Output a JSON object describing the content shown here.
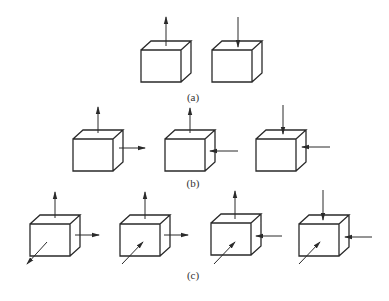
{
  "figure": {
    "colors": {
      "line": "#2a2a2a",
      "background": "#ffffff"
    },
    "rows": [
      {
        "label": "(a)",
        "label_pos": [
          193,
          97
        ],
        "boxes": [
          {
            "front": [
              141,
              50,
              40,
              32
            ],
            "depth": [
              10,
              9
            ],
            "arrows": [
              {
                "dir": "up-out",
                "from": [
                  166,
                  46
                ],
                "to": [
                  166,
                  17
                ]
              }
            ]
          },
          {
            "front": [
              212,
              50,
              40,
              32
            ],
            "depth": [
              10,
              9
            ],
            "arrows": [
              {
                "dir": "down-in",
                "from": [
                  238,
                  17
                ],
                "to": [
                  238,
                  47
                ]
              }
            ]
          }
        ]
      },
      {
        "label": "(b)",
        "label_pos": [
          193,
          183
        ],
        "boxes": [
          {
            "front": [
              73,
              139,
              40,
              32
            ],
            "depth": [
              10,
              9
            ],
            "arrows": [
              {
                "dir": "up-out",
                "from": [
                  98,
                  133
                ],
                "to": [
                  98,
                  107
                ]
              },
              {
                "dir": "right-out",
                "from": [
                  119,
                  148
                ],
                "to": [
                  145,
                  148
                ]
              }
            ]
          },
          {
            "front": [
              165,
              139,
              40,
              32
            ],
            "depth": [
              10,
              9
            ],
            "arrows": [
              {
                "dir": "up-out",
                "from": [
                  190,
                  133
                ],
                "to": [
                  190,
                  108
                ]
              },
              {
                "dir": "left-in",
                "from": [
                  238,
                  151
                ],
                "to": [
                  210,
                  151
                ]
              }
            ]
          },
          {
            "front": [
              256,
              139,
              40,
              32
            ],
            "depth": [
              10,
              9
            ],
            "arrows": [
              {
                "dir": "down-in",
                "from": [
                  283,
                  105
                ],
                "to": [
                  283,
                  134
                ]
              },
              {
                "dir": "left-in",
                "from": [
                  330,
                  147
                ],
                "to": [
                  302,
                  147
                ]
              }
            ]
          }
        ]
      },
      {
        "label": "(c)",
        "label_pos": [
          193,
          275
        ],
        "boxes": [
          {
            "front": [
              30,
              224,
              40,
              32
            ],
            "depth": [
              10,
              9
            ],
            "arrows": [
              {
                "dir": "up-out",
                "from": [
                  55,
                  218
                ],
                "to": [
                  55,
                  192
                ]
              },
              {
                "dir": "right-out",
                "from": [
                  75,
                  235
                ],
                "to": [
                  99,
                  235
                ]
              },
              {
                "dir": "diag-out",
                "from": [
                  47,
                  242
                ],
                "to": [
                  27,
                  264
                ]
              }
            ]
          },
          {
            "front": [
              120,
              224,
              40,
              32
            ],
            "depth": [
              10,
              9
            ],
            "arrows": [
              {
                "dir": "up-out",
                "from": [
                  145,
                  219
                ],
                "to": [
                  145,
                  192
                ]
              },
              {
                "dir": "right-out",
                "from": [
                  164,
                  235
                ],
                "to": [
                  188,
                  235
                ]
              },
              {
                "dir": "diag-in",
                "from": [
                  122,
                  264
                ],
                "to": [
                  143,
                  242
                ]
              }
            ]
          },
          {
            "front": [
              211,
              223,
              40,
              32
            ],
            "depth": [
              10,
              9
            ],
            "arrows": [
              {
                "dir": "up-out",
                "from": [
                  235,
                  219
                ],
                "to": [
                  235,
                  191
                ]
              },
              {
                "dir": "left-in",
                "from": [
                  282,
                  236
                ],
                "to": [
                  256,
                  236
                ]
              },
              {
                "dir": "diag-in",
                "from": [
                  214,
                  264
                ],
                "to": [
                  235,
                  242
                ]
              }
            ]
          },
          {
            "front": [
              299,
              224,
              40,
              32
            ],
            "depth": [
              10,
              9
            ],
            "arrows": [
              {
                "dir": "down-in",
                "from": [
                  323,
                  190
                ],
                "to": [
                  323,
                  220
                ]
              },
              {
                "dir": "left-in",
                "from": [
                  372,
                  237
                ],
                "to": [
                  345,
                  237
                ]
              },
              {
                "dir": "diag-in",
                "from": [
                  299,
                  264
                ],
                "to": [
                  320,
                  242
                ]
              }
            ]
          }
        ]
      }
    ]
  }
}
